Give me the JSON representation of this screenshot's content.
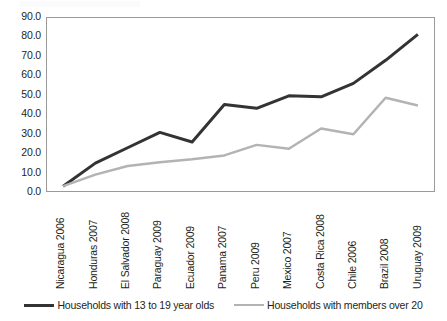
{
  "chart_data": {
    "type": "line",
    "title": "",
    "xlabel": "",
    "ylabel": "",
    "ylim": [
      0,
      90
    ],
    "yticks": [
      0,
      10,
      20,
      30,
      40,
      50,
      60,
      70,
      80,
      90
    ],
    "ytick_labels": [
      "0.0",
      "10.0",
      "20.0",
      "30.0",
      "40.0",
      "50.0",
      "60.0",
      "70.0",
      "80.0",
      "90.0"
    ],
    "grid": false,
    "legend_position": "bottom",
    "categories": [
      "Nicaragua 2006",
      "Honduras 2007",
      "El Salvador 2008",
      "Paraguay 2009",
      "Ecuador 2009",
      "Panama 2007",
      "Peru 2009",
      "Mexico 2007",
      "Costa Rica 2008",
      "Chile 2006",
      "Brazil 2008",
      "Uruguay 2009"
    ],
    "series": [
      {
        "name": "Households with 13 to 19 year olds",
        "color": "#333333",
        "width": 3,
        "values": [
          2.5,
          14.5,
          22.5,
          30.5,
          25.5,
          45.0,
          43.0,
          49.5,
          49.0,
          56.0,
          68.0,
          81.5
        ]
      },
      {
        "name": "Households with members over 20",
        "color": "#b3b3b3",
        "width": 2.5,
        "values": [
          2.5,
          8.5,
          13.0,
          15.0,
          16.5,
          18.5,
          24.0,
          22.0,
          32.5,
          29.5,
          48.5,
          44.5
        ]
      }
    ]
  },
  "legend": {
    "items": [
      {
        "label": "Households with 13 to 19 year olds",
        "color": "#333333"
      },
      {
        "label": "Households with members over 20",
        "color": "#b3b3b3"
      }
    ]
  },
  "colors": {
    "axis": "#9a9a9a",
    "text": "#231f20",
    "series_dark": "#333333",
    "series_light": "#b3b3b3",
    "background": "#ffffff"
  }
}
